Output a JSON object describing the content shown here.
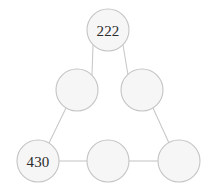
{
  "figure": {
    "background_color": "#ffffff",
    "width": 208,
    "height": 194
  },
  "style": {
    "node_fill": "#f6f6f6",
    "node_stroke": "#c4c4c4",
    "edge_stroke": "#c9c9c9",
    "label_color": "#2b2b2b",
    "node_radius": 21
  },
  "nodes": [
    {
      "id": "top",
      "label": "222",
      "cx": 108,
      "cy": 30,
      "r": 21,
      "filled": true
    },
    {
      "id": "mid-left",
      "label": "",
      "cx": 77,
      "cy": 90,
      "r": 21,
      "filled": false
    },
    {
      "id": "mid-right",
      "label": "",
      "cx": 142,
      "cy": 90,
      "r": 21,
      "filled": false
    },
    {
      "id": "bottom-left",
      "label": "430",
      "cx": 38,
      "cy": 161,
      "r": 21,
      "filled": true
    },
    {
      "id": "bottom-middle",
      "label": "",
      "cx": 108,
      "cy": 161,
      "r": 21,
      "filled": false
    },
    {
      "id": "bottom-right",
      "label": "",
      "cx": 179,
      "cy": 161,
      "r": 21,
      "filled": false
    }
  ],
  "edges": [
    {
      "id": "top-to-mid-left",
      "from": "top",
      "to": "mid-left",
      "x1": 93,
      "y1": 45,
      "x2": 92,
      "y2": 75
    },
    {
      "id": "top-to-mid-right",
      "from": "top",
      "to": "mid-right",
      "x1": 123,
      "y1": 45,
      "x2": 128,
      "y2": 75
    },
    {
      "id": "mid-left-to-bottom-left",
      "from": "mid-left",
      "to": "bottom-left",
      "x1": 66,
      "y1": 108,
      "x2": 49,
      "y2": 143
    },
    {
      "id": "mid-right-to-bottom-right",
      "from": "mid-right",
      "to": "bottom-right",
      "x1": 153,
      "y1": 108,
      "x2": 169,
      "y2": 143
    },
    {
      "id": "bottom-left-to-bottom-middle",
      "from": "bottom-left",
      "to": "bottom-middle",
      "x1": 59,
      "y1": 161,
      "x2": 87,
      "y2": 161
    },
    {
      "id": "bottom-middle-to-bottom-right",
      "from": "bottom-middle",
      "to": "bottom-right",
      "x1": 129,
      "y1": 161,
      "x2": 158,
      "y2": 161
    }
  ]
}
